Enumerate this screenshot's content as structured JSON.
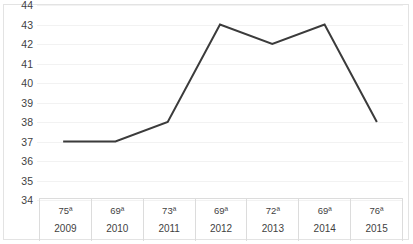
{
  "chart_data": {
    "type": "line",
    "title": "",
    "subtitle": "",
    "xlabel": "",
    "ylabel": "",
    "ylim": [
      34,
      44
    ],
    "ytick_step": 1,
    "yticks": [
      44,
      43,
      42,
      41,
      40,
      39,
      38,
      37,
      36,
      35,
      34
    ],
    "categories": [
      "2009",
      "2010",
      "2011",
      "2012",
      "2013",
      "2014",
      "2015"
    ],
    "values": [
      37,
      37,
      38,
      43,
      42,
      43,
      38
    ],
    "point_labels": [
      "75ª",
      "69ª",
      "73ª",
      "69ª",
      "72ª",
      "69ª",
      "76ª"
    ],
    "series": [
      {
        "name": "",
        "values": [
          37,
          37,
          38,
          43,
          42,
          43,
          38
        ],
        "color": "#3b3b3b"
      }
    ],
    "grid": true,
    "grid_color": "#f2f2f2",
    "legend": false,
    "legend_position": "none",
    "markers": false,
    "line_width": 2
  },
  "axis": {
    "y_ticks": [
      {
        "label": "44",
        "value": 44
      },
      {
        "label": "43",
        "value": 43
      },
      {
        "label": "42",
        "value": 42
      },
      {
        "label": "41",
        "value": 41
      },
      {
        "label": "40",
        "value": 40
      },
      {
        "label": "39",
        "value": 39
      },
      {
        "label": "38",
        "value": 38
      },
      {
        "label": "37",
        "value": 37
      },
      {
        "label": "36",
        "value": 36
      },
      {
        "label": "35",
        "value": 35
      },
      {
        "label": "34",
        "value": 34
      }
    ]
  },
  "x_table": {
    "columns": [
      {
        "rank": "75ª",
        "year": "2009"
      },
      {
        "rank": "69ª",
        "year": "2010"
      },
      {
        "rank": "73ª",
        "year": "2011"
      },
      {
        "rank": "69ª",
        "year": "2012"
      },
      {
        "rank": "72ª",
        "year": "2013"
      },
      {
        "rank": "69ª",
        "year": "2014"
      },
      {
        "rank": "76ª",
        "year": "2015"
      }
    ]
  },
  "colors": {
    "line": "#3b3b3b",
    "grid": "#f2f2f2",
    "border": "#e3e3e3",
    "table_border": "#dcdcdc",
    "text": "#3f3f3f",
    "background": "#ffffff"
  }
}
